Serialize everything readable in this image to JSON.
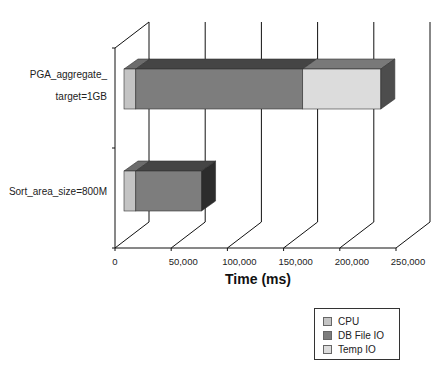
{
  "chart_data": {
    "type": "bar",
    "orientation": "horizontal",
    "stacked": true,
    "three_d": true,
    "title": "",
    "xlabel": "Time (ms)",
    "ylabel": "",
    "xlim": [
      0,
      250000
    ],
    "x_ticks": [
      "0",
      "50,000",
      "100,000",
      "150,000",
      "200,000",
      "250,000"
    ],
    "x_tick_values": [
      0,
      50000,
      100000,
      150000,
      200000,
      250000
    ],
    "categories": [
      "PGA_aggregate_target=1GB",
      "Sort_area_size=800M"
    ],
    "category_label_lines": [
      [
        "PGA_aggregate_",
        "target=1GB"
      ],
      [
        "Sort_area_size=800M"
      ]
    ],
    "series": [
      {
        "name": "CPU",
        "color": "#c4c4c4",
        "values": [
          10500,
          10500
        ]
      },
      {
        "name": "DB File IO",
        "color": "#7d7d7d",
        "values": [
          148500,
          58500
        ]
      },
      {
        "name": "Temp IO",
        "color": "#dcdcdc",
        "values": [
          69500,
          0
        ]
      }
    ],
    "grid": true,
    "legend_position": "bottom-right"
  },
  "legend": {
    "items": [
      {
        "label": "CPU",
        "color": "#c4c4c4"
      },
      {
        "label": "DB File IO",
        "color": "#7d7d7d"
      },
      {
        "label": "Temp IO",
        "color": "#dcdcdc"
      }
    ]
  }
}
